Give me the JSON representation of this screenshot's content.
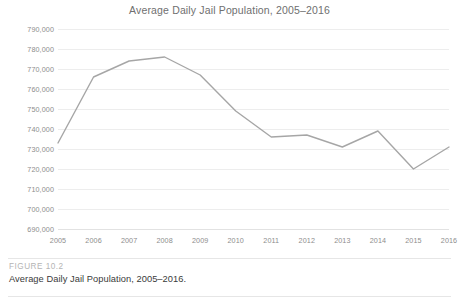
{
  "figure": {
    "number_label": "FIGURE 10.2",
    "caption": "Average Daily Jail Population, 2005–2016."
  },
  "chart_data": {
    "type": "line",
    "title": "Average Daily Jail Population, 2005–2016",
    "xlabel": "",
    "ylabel": "",
    "categories": [
      "2005",
      "2006",
      "2007",
      "2008",
      "2009",
      "2010",
      "2011",
      "2012",
      "2013",
      "2014",
      "2015",
      "2016"
    ],
    "x": [
      2005,
      2006,
      2007,
      2008,
      2009,
      2010,
      2011,
      2012,
      2013,
      2014,
      2015,
      2016
    ],
    "values": [
      733000,
      766000,
      774000,
      776000,
      767000,
      749000,
      736000,
      737000,
      731000,
      739000,
      720000,
      731000
    ],
    "ylim": [
      690000,
      790000
    ],
    "y_ticks": [
      790000,
      780000,
      770000,
      760000,
      750000,
      740000,
      730000,
      720000,
      710000,
      700000,
      690000
    ],
    "y_tick_labels": [
      "790,000",
      "780,000",
      "770,000",
      "760,000",
      "750,000",
      "740,000",
      "730,000",
      "720,000",
      "710,000",
      "700,000",
      "690,000"
    ],
    "grid": true,
    "legend": false,
    "legend_position": "none",
    "series": [
      {
        "name": "Average Daily Jail Population",
        "color": "#a6a6a6",
        "values": [
          733000,
          766000,
          774000,
          776000,
          767000,
          749000,
          736000,
          737000,
          731000,
          739000,
          720000,
          731000
        ]
      }
    ],
    "colors": {
      "line": "#a6a6a6",
      "grid": "#ededed",
      "axis_text": "#8d8d8d",
      "title_text": "#6f6f6f",
      "background": "#ffffff"
    }
  }
}
